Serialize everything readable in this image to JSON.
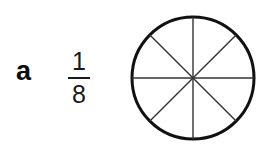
{
  "item": {
    "label": "a",
    "fraction": {
      "numerator": "1",
      "denominator": "8",
      "value_text": "1/8"
    }
  },
  "diagram": {
    "shape_name": "circle",
    "total_parts": 8,
    "shaded_parts": 0,
    "divider_count": 4,
    "divider_angles_deg": [
      0,
      45,
      90,
      135
    ],
    "outline_color": "#111111",
    "divider_color": "#333333",
    "fill_color": "#ffffff",
    "outline_width_px": 3,
    "divider_width_px": 1.4
  },
  "page": {
    "background_color": "#ffffff"
  }
}
